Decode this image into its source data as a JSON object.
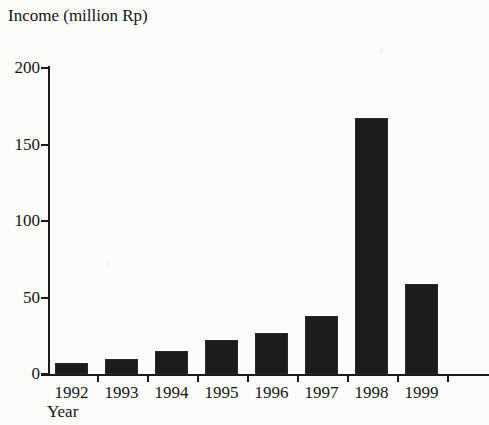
{
  "chart_data": {
    "type": "bar",
    "title": "Income (million Rp)",
    "xlabel": "Year",
    "ylabel": "Income (million Rp)",
    "categories": [
      "1992",
      "1993",
      "1994",
      "1995",
      "1996",
      "1997",
      "1998",
      "1999"
    ],
    "values": [
      7,
      10,
      15,
      22,
      27,
      38,
      167,
      59
    ],
    "ylim": [
      0,
      200
    ],
    "yticks": [
      0,
      50,
      100,
      150,
      200
    ],
    "ytick_labels": [
      "0",
      "50",
      "100",
      "150",
      "200"
    ],
    "grid": false,
    "legend": false,
    "bar_color": "#1c1c1c",
    "axis_color": "#1b1b1b",
    "background_color": "#fcfcfb"
  }
}
